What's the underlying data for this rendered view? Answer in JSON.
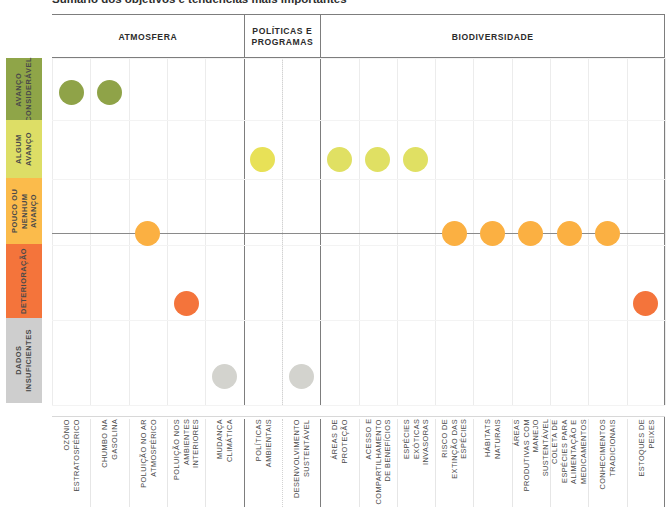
{
  "caption": "Sumário dos objetivos e tendências mais importantes",
  "legend_title": "Escala de avaliação",
  "bands": [
    {
      "id": "avanco-consideravel",
      "label": "AVANÇO\nCONSIDERÁVEL",
      "color": "#8FA548",
      "top": 0,
      "height": 62
    },
    {
      "id": "algum-avanco",
      "label": "ALGUM\nAVANÇO",
      "color": "#DDDE66",
      "top": 62,
      "height": 58
    },
    {
      "id": "pouco-ou-nenhum-avanco",
      "label": "POUCO OU\nNENHUM AVANÇO",
      "color": "#FBBB4B",
      "top": 120,
      "height": 66
    },
    {
      "id": "deterioracao",
      "label": "DETERIORAÇÃO",
      "color": "#F4743B",
      "top": 186,
      "height": 74
    },
    {
      "id": "dados-insuficientes",
      "label": "DADOS\nINSUFICIENTES",
      "color": "#CECECE",
      "top": 260,
      "height": 85
    }
  ],
  "groups": [
    {
      "id": "atmosfera",
      "label": "ATMOSFERA",
      "start": 0,
      "span": 5
    },
    {
      "id": "politicas-e-programas",
      "label": "POLÍTICAS E\nPROGRAMAS",
      "start": 5,
      "span": 2
    },
    {
      "id": "biodiversidade",
      "label": "BIODIVERSIDADE",
      "start": 7,
      "span": 9
    }
  ],
  "chart_data": {
    "type": "scatter",
    "title": "Sumário dos objetivos e tendências mais importantes",
    "xlabel": "",
    "ylabel": "",
    "grid": true,
    "legend_position": "left",
    "y_categories": [
      "AVANÇO CONSIDERÁVEL",
      "ALGUM AVANÇO",
      "POUCO OU NENHUM AVANÇO",
      "DETERIORAÇÃO",
      "DADOS INSUFICIENTES"
    ],
    "categories": [
      "OZÔNIO\nESTRATOSFÉRICO",
      "CHUMBO NA\nGASOLINA",
      "POLUIÇÃO NO AR\nATMOSFÉRICO",
      "POLUIÇÃO NOS\nAMBIENTES\nINTERIORES",
      "MUDANÇA\nCLIMÁTICA",
      "POLÍTICAS\nAMBIENTAIS",
      "DESENVOLVIMENTO\nSUSTENTÁVEL",
      "ÁREAS DE\nPROTEÇÃO",
      "ACESSO E\nCOMPARTILHAMENTO\nDE BENEFÍCIOS",
      "ESPÉCIES\nEXÓTICAS\nINVASORAS",
      "RISCO DE\nEXTINÇÃO DAS\nESPÉCIES",
      "HÁBITATS\nNATURAIS",
      "ÁREAS\nPRODUTIVAS COM\nMANEJO\nSUSTENTÁVEL",
      "COLETA DE\nESPÉCIES PARA\nALIMENTAÇÃO E\nMEDICAMENTOS",
      "CONHECIMENTOS\nTRADICIONAIS",
      "ESTOQUES DE\nPEIXES"
    ],
    "points": [
      {
        "category": "OZÔNIO ESTRATOSFÉRICO",
        "col": 0,
        "rating": "AVANÇO CONSIDERÁVEL",
        "value": 5,
        "color": "#8FA348"
      },
      {
        "category": "CHUMBO NA GASOLINA",
        "col": 1,
        "rating": "AVANÇO CONSIDERÁVEL",
        "value": 5,
        "color": "#8FA348"
      },
      {
        "category": "POLUIÇÃO NO AR ATMOSFÉRICO",
        "col": 2,
        "rating": "POUCO OU NENHUM AVANÇO",
        "value": 3,
        "color": "#FBB042"
      },
      {
        "category": "POLUIÇÃO NOS AMBIENTES INTERIORES",
        "col": 3,
        "rating": "DETERIORAÇÃO",
        "value": 2,
        "color": "#F4743B"
      },
      {
        "category": "MUDANÇA CLIMÁTICA",
        "col": 4,
        "rating": "DADOS INSUFICIENTES",
        "value": 1,
        "color": "#D3D3CE"
      },
      {
        "category": "POLÍTICAS AMBIENTAIS",
        "col": 5,
        "rating": "ALGUM AVANÇO",
        "value": 4,
        "color": "#E8E157"
      },
      {
        "category": "DESENVOLVIMENTO SUSTENTÁVEL",
        "col": 6,
        "rating": "DADOS INSUFICIENTES",
        "value": 1,
        "color": "#D3D3CE"
      },
      {
        "category": "ÁREAS DE PROTEÇÃO",
        "col": 7,
        "rating": "ALGUM AVANÇO",
        "value": 4,
        "color": "#E0E063"
      },
      {
        "category": "ACESSO E COMPARTILHAMENTO DE BENEFÍCIOS",
        "col": 8,
        "rating": "ALGUM AVANÇO",
        "value": 4,
        "color": "#E0E063"
      },
      {
        "category": "ESPÉCIES EXÓTICAS INVASORAS",
        "col": 9,
        "rating": "ALGUM AVANÇO",
        "value": 4,
        "color": "#E0E063"
      },
      {
        "category": "RISCO DE EXTINÇÃO DAS ESPÉCIES",
        "col": 10,
        "rating": "POUCO OU NENHUM AVANÇO",
        "value": 3,
        "color": "#FBB042"
      },
      {
        "category": "HÁBITATS NATURAIS",
        "col": 11,
        "rating": "POUCO OU NENHUM AVANÇO",
        "value": 3,
        "color": "#FBB042"
      },
      {
        "category": "ÁREAS PRODUTIVAS COM MANEJO SUSTENTÁVEL",
        "col": 12,
        "rating": "POUCO OU NENHUM AVANÇO",
        "value": 3,
        "color": "#FBB042"
      },
      {
        "category": "COLETA DE ESPÉCIES PARA ALIMENTAÇÃO E MEDICAMENTOS",
        "col": 13,
        "rating": "POUCO OU NENHUM AVANÇO",
        "value": 3,
        "color": "#FBB042"
      },
      {
        "category": "CONHECIMENTOS TRADICIONAIS",
        "col": 14,
        "rating": "POUCO OU NENHUM AVANÇO",
        "value": 3,
        "color": "#FBB042"
      },
      {
        "category": "ESTOQUES DE PEIXES",
        "col": 15,
        "rating": "DETERIORAÇÃO",
        "value": 2,
        "color": "#F4743B"
      }
    ]
  }
}
